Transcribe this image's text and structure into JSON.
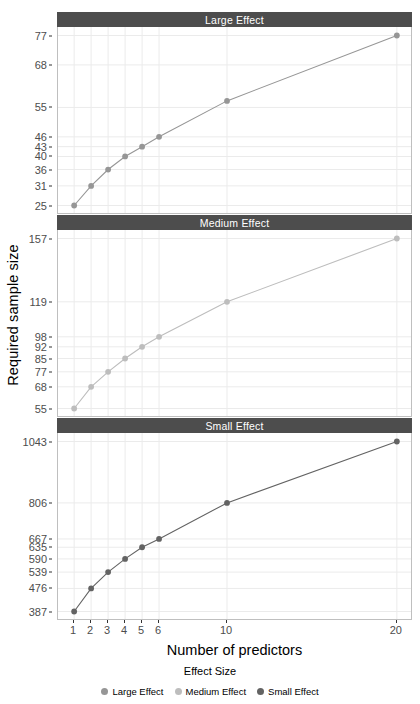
{
  "chart_data": {
    "type": "line",
    "title": "",
    "xlabel": "Number of predictors",
    "ylabel": "Required sample size",
    "legend_title": "Effect Size",
    "legend_position": "bottom",
    "grid": true,
    "x": [
      1,
      2,
      3,
      4,
      5,
      6,
      10,
      20
    ],
    "xlim": [
      0.05,
      20.95
    ],
    "xticks": [
      "1",
      "2",
      "3",
      "4",
      "5",
      "6",
      "10",
      "20"
    ],
    "facets": [
      {
        "label": "Large Effect",
        "series_name": "Large Effect",
        "color": "#969696",
        "values": [
          25,
          31,
          36,
          40,
          43,
          46,
          57,
          77
        ],
        "yticks": [
          25,
          31,
          36,
          40,
          43,
          46,
          55,
          68,
          77
        ],
        "ytick_labels": [
          "25",
          "31",
          "36",
          "40",
          "43",
          "46",
          "55",
          "68",
          "77"
        ],
        "ylim": [
          22.4,
          79.6
        ]
      },
      {
        "label": "Medium Effect",
        "series_name": "Medium Effect",
        "color": "#bdbdbd",
        "values": [
          55,
          68,
          77,
          85,
          92,
          98,
          119,
          157
        ],
        "yticks": [
          55,
          68,
          77,
          85,
          92,
          98,
          119,
          157
        ],
        "ytick_labels": [
          "55",
          "68",
          "77",
          "85",
          "92",
          "98",
          "119",
          "157"
        ],
        "ylim": [
          49.9,
          162.1
        ]
      },
      {
        "label": "Small Effect",
        "series_name": "Small Effect",
        "color": "#636363",
        "values": [
          387,
          476,
          539,
          590,
          635,
          667,
          806,
          1043
        ],
        "yticks": [
          387,
          476,
          539,
          590,
          635,
          667,
          806,
          1043
        ],
        "ytick_labels": [
          "387",
          "476",
          "539",
          "590",
          "635",
          "667",
          "806",
          "1043"
        ],
        "ylim": [
          354.2,
          1075.8
        ]
      }
    ],
    "legend": [
      {
        "label": "Large Effect",
        "color": "#969696"
      },
      {
        "label": "Medium Effect",
        "color": "#bdbdbd"
      },
      {
        "label": "Small Effect",
        "color": "#636363"
      }
    ]
  },
  "theme": {
    "strip_background": "#4d4d4d",
    "strip_text": "#ffffff",
    "panel_background": "#ffffff",
    "panel_border": "#bfbfbf",
    "grid_major": "#ebebeb",
    "grid_minor": "#f4f4f4",
    "axis_text": "#4d4d4d",
    "axis_title": "#000000"
  }
}
